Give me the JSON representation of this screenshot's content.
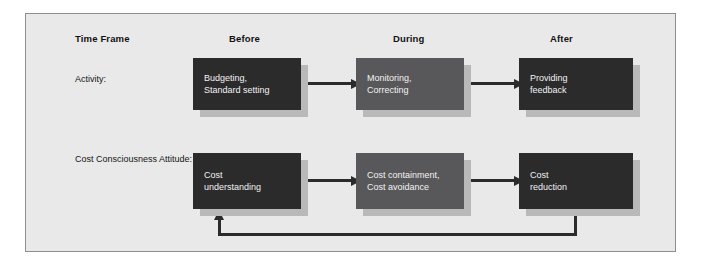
{
  "figure": {
    "background_color": "#e9e9e9",
    "border_color": "#8e8e8e",
    "dark_box_color": "#2b2b2b",
    "mid_box_color": "#58585a",
    "shadow_color": "#b9b9b9",
    "arrow_color": "#2b2b2b",
    "box_text_color": "#f2f2f2"
  },
  "headers": {
    "row_label_header": "Time Frame",
    "columns": [
      {
        "label": "Before"
      },
      {
        "label": "During"
      },
      {
        "label": "After"
      }
    ]
  },
  "rows": [
    {
      "label": "Activity:",
      "nodes": [
        {
          "text": "Budgeting,\nStandard setting",
          "shade": "dark"
        },
        {
          "text": "Monitoring,\nCorrecting",
          "shade": "mid"
        },
        {
          "text": "Providing\nfeedback",
          "shade": "dark"
        }
      ]
    },
    {
      "label": "Cost\nConsciousness\nAttitude:",
      "nodes": [
        {
          "text": "Cost\nunderstanding",
          "shade": "dark"
        },
        {
          "text": "Cost containment,\nCost avoidance",
          "shade": "mid"
        },
        {
          "text": "Cost\nreduction",
          "shade": "dark"
        }
      ]
    }
  ],
  "connectors": {
    "row1_arrow1": "Budgeting, Standard setting to Monitoring, Correcting",
    "row1_arrow2": "Monitoring, Correcting to Providing feedback",
    "row2_arrow1": "Cost understanding to Cost containment, Cost avoidance",
    "row2_arrow2": "Cost containment, Cost avoidance to Cost reduction",
    "feedback_loop": "Cost reduction back to Cost understanding"
  }
}
